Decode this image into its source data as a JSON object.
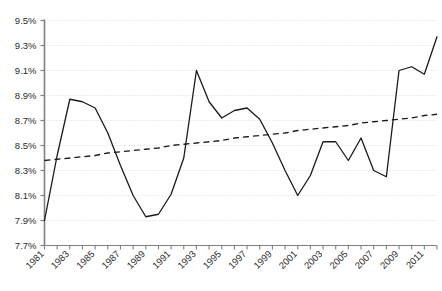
{
  "chart_data": {
    "type": "line",
    "title": "",
    "subtitle": "",
    "xlabel": "",
    "ylabel": "",
    "grid": true,
    "legend": "none",
    "xlim": [
      1981,
      2012
    ],
    "ylim": [
      7.7,
      9.5
    ],
    "ytick_step": 0.2,
    "ytick_labels": [
      "7.7%",
      "7.9%",
      "8.1%",
      "8.3%",
      "8.5%",
      "8.7%",
      "8.9%",
      "9.1%",
      "9.3%",
      "9.5%"
    ],
    "ytick_values": [
      7.7,
      7.9,
      8.1,
      8.3,
      8.5,
      8.7,
      8.9,
      9.1,
      9.3,
      9.5
    ],
    "xtick_values": [
      1981,
      1982,
      1983,
      1984,
      1985,
      1986,
      1987,
      1988,
      1989,
      1990,
      1991,
      1992,
      1993,
      1994,
      1995,
      1996,
      1997,
      1998,
      1999,
      2000,
      2001,
      2002,
      2003,
      2004,
      2005,
      2006,
      2007,
      2008,
      2009,
      2010,
      2011,
      2012
    ],
    "xtick_labels": [
      "1981",
      "",
      "1983",
      "",
      "1985",
      "",
      "1987",
      "",
      "1989",
      "",
      "1991",
      "",
      "1993",
      "",
      "1995",
      "",
      "1997",
      "",
      "1999",
      "",
      "2001",
      "",
      "2003",
      "",
      "2005",
      "",
      "2007",
      "",
      "2009",
      "",
      "2011",
      ""
    ],
    "x": [
      1981,
      1982,
      1983,
      1984,
      1985,
      1986,
      1987,
      1988,
      1989,
      1990,
      1991,
      1992,
      1993,
      1994,
      1995,
      1996,
      1997,
      1998,
      1999,
      2000,
      2001,
      2002,
      2003,
      2004,
      2005,
      2006,
      2007,
      2008,
      2009,
      2010,
      2011,
      2012
    ],
    "series": [
      {
        "name": "value",
        "style": "solid",
        "color": "#1a1a1a",
        "values": [
          7.9,
          8.42,
          8.87,
          8.85,
          8.8,
          8.6,
          8.34,
          8.1,
          7.93,
          7.95,
          8.11,
          8.4,
          9.1,
          8.85,
          8.72,
          8.78,
          8.8,
          8.71,
          8.52,
          8.3,
          8.1,
          8.26,
          8.53,
          8.53,
          8.38,
          8.56,
          8.3,
          8.25,
          9.1,
          9.13,
          9.07,
          9.37
        ]
      },
      {
        "name": "trendline",
        "style": "dashed",
        "color": "#1a1a1a",
        "values": [
          8.38,
          8.39,
          8.4,
          8.41,
          8.42,
          8.44,
          8.45,
          8.46,
          8.47,
          8.48,
          8.5,
          8.51,
          8.52,
          8.53,
          8.54,
          8.56,
          8.57,
          8.58,
          8.59,
          8.6,
          8.62,
          8.63,
          8.64,
          8.65,
          8.66,
          8.68,
          8.69,
          8.7,
          8.71,
          8.72,
          8.74,
          8.75
        ]
      }
    ]
  },
  "colors": {
    "line": "#1a1a1a",
    "trendline": "#1a1a1a",
    "grid": "#d9d9d9",
    "axis": "#808080",
    "text": "#2b2b2b",
    "background": "#ffffff"
  }
}
